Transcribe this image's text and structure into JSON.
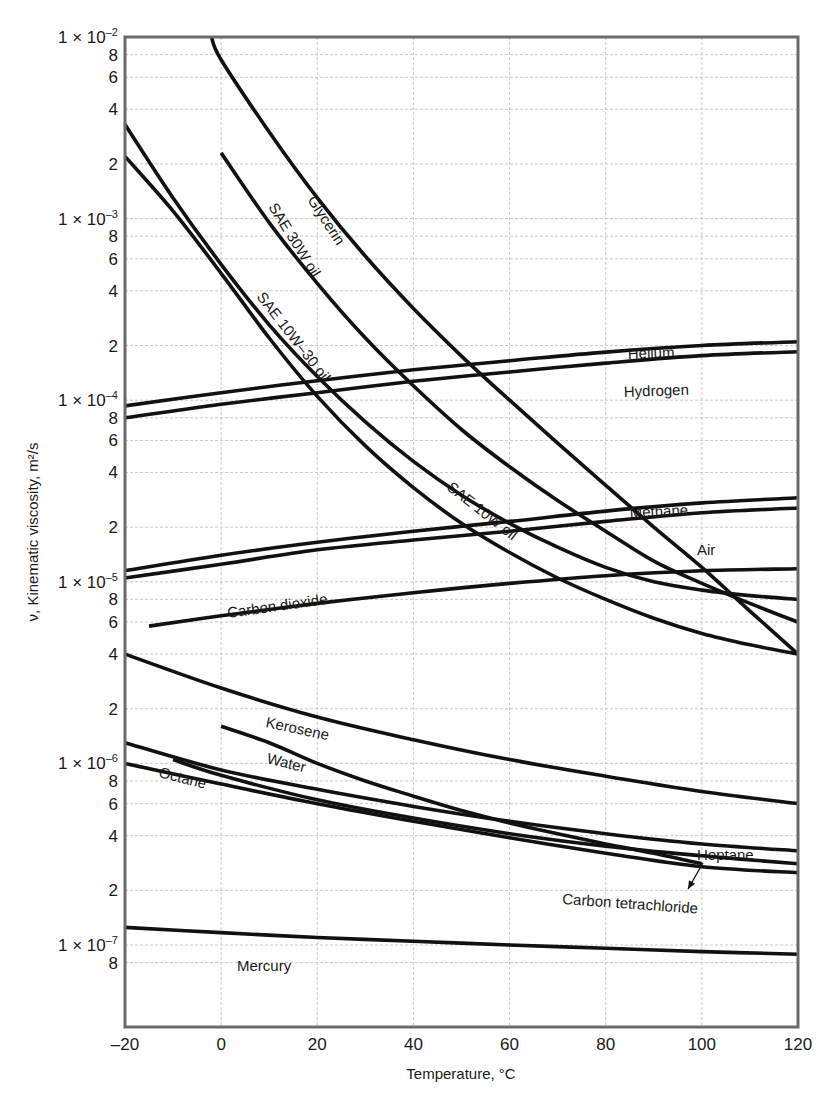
{
  "chart_data": {
    "type": "line",
    "title": "",
    "xlabel": "Temperature, °C",
    "ylabel": "ν, Kinematic viscosity, m²/s",
    "yscale": "log",
    "xlim": [
      -20,
      120
    ],
    "ylim": [
      7e-08,
      0.01
    ],
    "grid": true,
    "x_ticks": [
      -20,
      0,
      20,
      40,
      60,
      80,
      100,
      120
    ],
    "x_tick_labels": [
      "–20",
      "0",
      "20",
      "40",
      "60",
      "80",
      "100",
      "120"
    ],
    "y_ticks": [
      {
        "value": 0.01,
        "label": "1 × 10",
        "exp": "–2"
      },
      {
        "value": 0.008,
        "label": "8"
      },
      {
        "value": 0.006,
        "label": "6"
      },
      {
        "value": 0.004,
        "label": "4"
      },
      {
        "value": 0.002,
        "label": "2"
      },
      {
        "value": 0.001,
        "label": "1 × 10",
        "exp": "–3"
      },
      {
        "value": 0.0008,
        "label": "8"
      },
      {
        "value": 0.0006,
        "label": "6"
      },
      {
        "value": 0.0004,
        "label": "4"
      },
      {
        "value": 0.0002,
        "label": "2"
      },
      {
        "value": 0.0001,
        "label": "1 × 10",
        "exp": "–4"
      },
      {
        "value": 8e-05,
        "label": "8"
      },
      {
        "value": 6e-05,
        "label": "6"
      },
      {
        "value": 4e-05,
        "label": "4"
      },
      {
        "value": 2e-05,
        "label": "2"
      },
      {
        "value": 1e-05,
        "label": "1 × 10",
        "exp": "–5"
      },
      {
        "value": 8e-06,
        "label": "8"
      },
      {
        "value": 6e-06,
        "label": "6"
      },
      {
        "value": 4e-06,
        "label": "4"
      },
      {
        "value": 2e-06,
        "label": "2"
      },
      {
        "value": 1e-06,
        "label": "1 × 10",
        "exp": "–6"
      },
      {
        "value": 8e-07,
        "label": "8"
      },
      {
        "value": 6e-07,
        "label": "6"
      },
      {
        "value": 4e-07,
        "label": "4"
      },
      {
        "value": 2e-07,
        "label": "2"
      },
      {
        "value": 1e-07,
        "label": "1 × 10",
        "exp": "–7"
      },
      {
        "value": 8e-08,
        "label": "8"
      }
    ],
    "series": [
      {
        "name": "Glycerin",
        "x": [
          -2,
          0,
          10,
          20,
          30,
          40,
          50,
          60,
          70,
          80,
          90,
          100,
          110,
          120
        ],
        "values": [
          0.01,
          0.0075,
          0.003,
          0.0013,
          0.00062,
          0.00032,
          0.000175,
          0.0001,
          5.8e-05,
          3.4e-05,
          2e-05,
          1.2e-05,
          6.9e-06,
          4e-06
        ],
        "label": {
          "text": "Glycerin",
          "x": 307,
          "y": 200,
          "rotate": 57
        }
      },
      {
        "name": "SAE 30W oil",
        "x": [
          0,
          10,
          20,
          30,
          40,
          50,
          60,
          70,
          80,
          90,
          100,
          110,
          120
        ],
        "values": [
          0.0023,
          0.00095,
          0.00044,
          0.00022,
          0.00012,
          6.9e-05,
          4.3e-05,
          2.8e-05,
          1.9e-05,
          1.3e-05,
          9.8e-06,
          7.6e-06,
          6e-06
        ],
        "label": {
          "text": "SAE 30W oil",
          "x": 268,
          "y": 207,
          "rotate": 58
        }
      },
      {
        "name": "SAE 10W–30 oil",
        "x": [
          -20,
          -10,
          0,
          10,
          20,
          30,
          40,
          50,
          60,
          70,
          80,
          90,
          100,
          110,
          120
        ],
        "values": [
          0.0033,
          0.0013,
          0.00056,
          0.00026,
          0.000135,
          7.6e-05,
          4.6e-05,
          3e-05,
          2.1e-05,
          1.55e-05,
          1.2e-05,
          1e-05,
          9e-06,
          8.4e-06,
          8e-06
        ],
        "label": {
          "text": "SAE 10W–30 oil",
          "x": 256,
          "y": 297,
          "rotate": 52
        }
      },
      {
        "name": "SAE 10W oil",
        "x": [
          -20,
          -10,
          0,
          10,
          20,
          30,
          40,
          50,
          60,
          70,
          80,
          90,
          100,
          110,
          120
        ],
        "values": [
          0.0022,
          0.0011,
          0.0005,
          0.00022,
          0.000105,
          5.6e-05,
          3.3e-05,
          2.1e-05,
          1.45e-05,
          1.05e-05,
          8e-06,
          6.3e-06,
          5.2e-06,
          4.5e-06,
          4e-06
        ],
        "label": {
          "text": "SAE 10W oil",
          "x": 446,
          "y": 489,
          "rotate": 38
        }
      },
      {
        "name": "Helium",
        "x": [
          -20,
          0,
          20,
          40,
          60,
          80,
          100,
          120
        ],
        "values": [
          9.3e-05,
          0.00011,
          0.000128,
          0.000147,
          0.000165,
          0.000184,
          0.0002,
          0.00021
        ],
        "label": {
          "text": "Helium",
          "x": 628,
          "y": 359,
          "rotate": -2
        }
      },
      {
        "name": "Hydrogen",
        "x": [
          -20,
          0,
          20,
          40,
          60,
          80,
          100,
          120
        ],
        "values": [
          8e-05,
          9.5e-05,
          0.00011,
          0.000127,
          0.000143,
          0.00016,
          0.000176,
          0.000185
        ],
        "label": {
          "text": "Hydrogen",
          "x": 624,
          "y": 397,
          "rotate": -2
        }
      },
      {
        "name": "Methane",
        "x": [
          -20,
          0,
          20,
          40,
          60,
          80,
          100,
          120
        ],
        "values": [
          1.15e-05,
          1.4e-05,
          1.65e-05,
          1.9e-05,
          2.15e-05,
          2.45e-05,
          2.72e-05,
          2.9e-05
        ],
        "label": {
          "text": "Methane",
          "x": 630,
          "y": 518,
          "rotate": -3
        }
      },
      {
        "name": "Air",
        "x": [
          -20,
          0,
          20,
          40,
          60,
          80,
          100,
          120
        ],
        "values": [
          1.05e-05,
          1.25e-05,
          1.5e-05,
          1.7e-05,
          1.9e-05,
          2.15e-05,
          2.4e-05,
          2.55e-05
        ],
        "label": {
          "text": "Air",
          "x": 697,
          "y": 555,
          "rotate": 0
        }
      },
      {
        "name": "Carbon dioxide",
        "x": [
          -15,
          0,
          20,
          40,
          60,
          80,
          100,
          120
        ],
        "values": [
          5.7e-06,
          6.5e-06,
          7.6e-06,
          8.7e-06,
          9.8e-06,
          1.08e-05,
          1.15e-05,
          1.18e-05
        ],
        "label": {
          "text": "Carbon dioxide",
          "x": 228,
          "y": 618,
          "rotate": -8
        }
      },
      {
        "name": "Kerosene",
        "x": [
          -20,
          0,
          20,
          40,
          60,
          80,
          100,
          120
        ],
        "values": [
          4e-06,
          2.6e-06,
          1.8e-06,
          1.35e-06,
          1.05e-06,
          8.5e-07,
          7e-07,
          6e-07
        ],
        "label": {
          "text": "Kerosene",
          "x": 265,
          "y": 727,
          "rotate": 12
        }
      },
      {
        "name": "Water",
        "x": [
          0,
          10,
          20,
          30,
          40,
          50,
          60,
          70,
          80,
          90,
          100
        ],
        "values": [
          1.6e-06,
          1.3e-06,
          1e-06,
          8e-07,
          6.6e-07,
          5.5e-07,
          4.7e-07,
          4.1e-07,
          3.6e-07,
          3.2e-07,
          2.8e-07
        ],
        "label": {
          "text": "Water",
          "x": 266,
          "y": 763,
          "rotate": 14
        }
      },
      {
        "name": "Octane",
        "x": [
          -20,
          0,
          20,
          40,
          60,
          80,
          100,
          120
        ],
        "values": [
          1.3e-06,
          9.2e-07,
          7.2e-07,
          5.8e-07,
          4.8e-07,
          4.1e-07,
          3.6e-07,
          3.3e-07
        ],
        "label": {
          "text": "Octane",
          "x": 158,
          "y": 777,
          "rotate": 14
        }
      },
      {
        "name": "Heptane",
        "x": [
          -10,
          0,
          20,
          40,
          60,
          80,
          100,
          120
        ],
        "values": [
          1.05e-06,
          8.6e-07,
          6.3e-07,
          5e-07,
          4.1e-07,
          3.5e-07,
          3.1e-07,
          2.8e-07
        ],
        "label": {
          "text": "Heptane",
          "x": 697,
          "y": 860,
          "rotate": 0
        }
      },
      {
        "name": "Carbon tetrachloride",
        "x": [
          -20,
          0,
          20,
          40,
          60,
          80,
          100,
          120
        ],
        "values": [
          1e-06,
          7.7e-07,
          6e-07,
          4.8e-07,
          3.9e-07,
          3.2e-07,
          2.7e-07,
          2.5e-07
        ],
        "label": {
          "text": "Carbon tetrachloride",
          "x": 562,
          "y": 904,
          "rotate": 4
        }
      },
      {
        "name": "Mercury",
        "x": [
          -20,
          0,
          20,
          40,
          60,
          80,
          100,
          120
        ],
        "values": [
          1.25e-07,
          1.17e-07,
          1.1e-07,
          1.05e-07,
          1e-07,
          9.6e-08,
          9.2e-08,
          8.9e-08
        ],
        "label": {
          "text": "Mercury",
          "x": 237,
          "y": 971,
          "rotate": 0
        }
      }
    ],
    "annotations": [
      {
        "text": "Heptane",
        "arrow_to": {
          "x": 688,
          "y": 889
        }
      }
    ]
  }
}
